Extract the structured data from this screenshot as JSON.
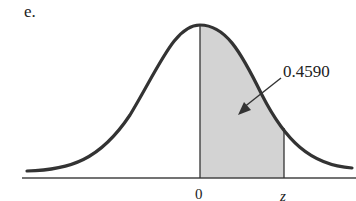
{
  "part_label": "e.",
  "figure": {
    "type": "normal-distribution-shaded-area",
    "shaded_region": {
      "from_label": "0",
      "to_label": "z"
    },
    "area_label": "0.4590",
    "axis_ticks": [
      "0",
      "z"
    ],
    "colors": {
      "curve": "#333333",
      "shade": "#d3d3d3",
      "axis": "#444444"
    }
  }
}
